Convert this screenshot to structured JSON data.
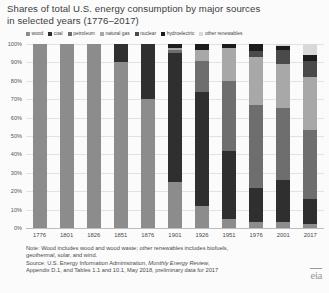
{
  "chart_data": {
    "type": "bar",
    "subtype": "stacked-100-percent",
    "title": "Shares of total U.S. energy consumption by major sources in selected years (1776–2017)",
    "title_lines": [
      "Shares of total U.S. energy consumption by major sources",
      "in selected years (1776–2017)"
    ],
    "xlabel": "",
    "ylabel": "",
    "ylim": [
      0,
      100
    ],
    "y_ticks": [
      "100%",
      "90%",
      "80%",
      "70%",
      "60%",
      "50%",
      "40%",
      "30%",
      "20%",
      "10%",
      "0%"
    ],
    "y_tick_values": [
      100,
      90,
      80,
      70,
      60,
      50,
      40,
      30,
      20,
      10,
      0
    ],
    "grid": true,
    "legend_position": "top",
    "categories": [
      "1776",
      "1801",
      "1826",
      "1851",
      "1876",
      "1901",
      "1926",
      "1951",
      "1976",
      "2001",
      "2017"
    ],
    "series": [
      {
        "name": "wood",
        "color": "#8c8c8c",
        "values": [
          100,
          100,
          100,
          90,
          70,
          25,
          12,
          5,
          3,
          3,
          2
        ]
      },
      {
        "name": "coal",
        "color": "#2f2f2f",
        "values": [
          0,
          0,
          0,
          10,
          30,
          70,
          62,
          37,
          19,
          23,
          14
        ]
      },
      {
        "name": "petroleum",
        "color": "#6e6e6e",
        "values": [
          0,
          0,
          0,
          0,
          0,
          2,
          17,
          38,
          45,
          39,
          37
        ]
      },
      {
        "name": "natural gas",
        "color": "#a8a8a8",
        "values": [
          0,
          0,
          0,
          0,
          0,
          1,
          6,
          18,
          26,
          24,
          29
        ]
      },
      {
        "name": "nuclear",
        "color": "#4a4a4a",
        "values": [
          0,
          0,
          0,
          0,
          0,
          0,
          0,
          0,
          3,
          8,
          9
        ]
      },
      {
        "name": "hydroelectric",
        "color": "#1c1c1c",
        "values": [
          0,
          0,
          0,
          0,
          0,
          2,
          3,
          2,
          4,
          2,
          3
        ]
      },
      {
        "name": "other renewables",
        "color": "#d8d8d8",
        "values": [
          0,
          0,
          0,
          0,
          0,
          0,
          0,
          0,
          0,
          1,
          6
        ]
      }
    ],
    "notes": [
      "Note: Wood includes wood and wood waste; other renewables includes biofuels,",
      "geothermal, solar, and wind."
    ],
    "source_lines": [
      {
        "pre": "Source: U.S. Energy Information Administration, ",
        "italic": "Monthly Energy Review",
        "post": ","
      },
      {
        "pre": "Appendix D.1, and Tables 1.1 and 10.1, May 2018, preliminary data for 2017",
        "italic": "",
        "post": ""
      }
    ],
    "logo_text": "eia"
  }
}
